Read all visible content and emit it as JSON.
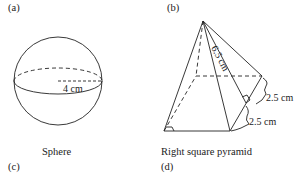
{
  "panels": {
    "a": {
      "label": "(a)"
    },
    "b": {
      "label": "(b)"
    },
    "c": {
      "label": "(c)"
    },
    "d": {
      "label": "(d)"
    }
  },
  "sphere": {
    "caption": "Sphere",
    "radius_label": "4 cm"
  },
  "pyramid": {
    "caption": "Right square pyramid",
    "slant_label": "6.5 cm",
    "half_side_label_upper": "2.5 cm",
    "half_side_label_lower": "2.5 cm"
  },
  "colors": {
    "stroke": "#222222",
    "background": "#ffffff"
  }
}
